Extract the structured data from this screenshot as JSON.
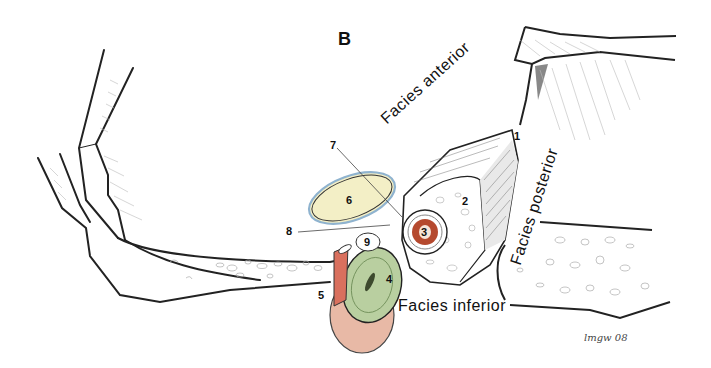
{
  "figure": {
    "panel_label": "B",
    "surfaces": {
      "anterior": "Facies anterior",
      "posterior": "Facies posterior",
      "inferior": "Facies inferior"
    },
    "numbers": {
      "n1": "1",
      "n2": "2",
      "n3": "3",
      "n4": "4",
      "n5": "5",
      "n6": "6",
      "n7": "7",
      "n8": "8",
      "n9": "9"
    },
    "signature": "lmgw 08",
    "colors": {
      "outline": "#222222",
      "structure_3": "#b5492e",
      "structure_4": "#b9cfa0",
      "structure_5": "#d9705e",
      "structure_6": "#f3efc6",
      "structure_6_rim": "#8fb3cf",
      "bone_fill": "#ffffff",
      "muscle_tissue": "#e8b9a6"
    }
  }
}
